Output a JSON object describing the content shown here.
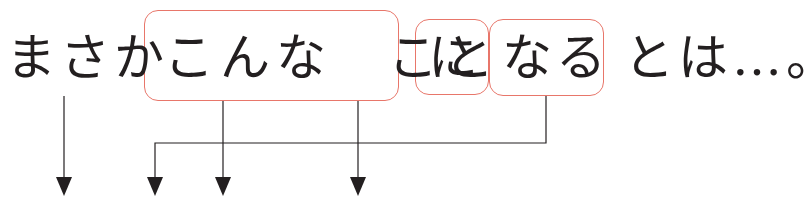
{
  "sentence": {
    "segments": [
      {
        "id": "masaka",
        "text": "まさか",
        "boxed": false
      },
      {
        "id": "konna-koto",
        "text": "こんな　こと",
        "boxed": true
      },
      {
        "id": "ni",
        "text": "に",
        "boxed": true
      },
      {
        "id": "naru",
        "text": "なる",
        "boxed": true
      },
      {
        "id": "towa",
        "text": "とは…。",
        "boxed": false
      }
    ]
  },
  "colors": {
    "box_border": "#e8766a",
    "text": "#231f20",
    "arrow": "#231f20"
  },
  "arrows": [
    {
      "from": "masaka",
      "to": "target-1"
    },
    {
      "from": "naru",
      "to": "target-2",
      "routing": "bracket"
    },
    {
      "from": "konna-koto",
      "to": "target-3"
    },
    {
      "from": "konna-koto",
      "to": "target-4"
    }
  ]
}
